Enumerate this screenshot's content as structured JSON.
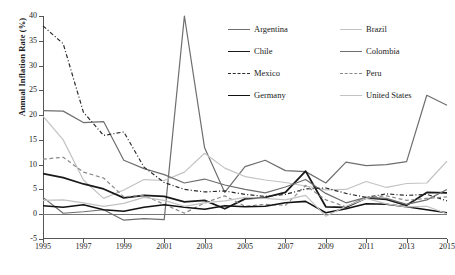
{
  "chart_data": {
    "type": "line",
    "title": "",
    "xlabel": "",
    "ylabel": "Annual Inflation Rate (%)",
    "xlim": [
      1995,
      2015
    ],
    "ylim": [
      -5,
      40
    ],
    "yticks": [
      -5,
      0,
      5,
      10,
      15,
      20,
      25,
      30,
      35,
      40
    ],
    "xticks": [
      1995,
      1997,
      1999,
      2001,
      2003,
      2005,
      2007,
      2009,
      2011,
      2013,
      2015
    ],
    "grid": false,
    "legend_position": "top-right",
    "x": [
      1995,
      1996,
      1997,
      1998,
      1999,
      2000,
      2001,
      2002,
      2003,
      2004,
      2005,
      2006,
      2007,
      2008,
      2009,
      2010,
      2011,
      2012,
      2013,
      2014,
      2015
    ],
    "series": [
      {
        "name": "Argentina",
        "color": "#6e6e6e",
        "width": 1.2,
        "dash": "none",
        "values": [
          3.4,
          0.2,
          0.5,
          0.9,
          -1.2,
          -0.9,
          -1.1,
          40.0,
          13.4,
          4.4,
          9.6,
          10.9,
          8.8,
          8.6,
          6.3,
          10.5,
          9.8,
          10.0,
          10.6,
          24.0,
          22.0
        ]
      },
      {
        "name": "Brazil",
        "color": "#c2c2c2",
        "width": 1.2,
        "dash": "none",
        "values": [
          19.8,
          15.0,
          6.9,
          3.2,
          4.9,
          7.0,
          6.8,
          8.5,
          12.3,
          9.3,
          7.6,
          6.9,
          6.4,
          5.7,
          4.9,
          5.0,
          6.6,
          5.4,
          6.2,
          6.3,
          10.7
        ]
      },
      {
        "name": "Chile",
        "color": "#1a1a1a",
        "width": 1.8,
        "dash": "none",
        "values": [
          8.2,
          7.4,
          6.1,
          5.1,
          3.3,
          3.8,
          3.6,
          2.5,
          2.8,
          1.1,
          3.1,
          3.4,
          4.4,
          8.7,
          1.5,
          1.4,
          3.3,
          3.0,
          1.8,
          4.4,
          4.3
        ]
      },
      {
        "name": "Colombia",
        "color": "#6e6e6e",
        "width": 1.2,
        "dash": "none",
        "values": [
          20.9,
          20.8,
          18.5,
          18.7,
          10.9,
          9.2,
          8.0,
          6.3,
          7.1,
          5.9,
          5.0,
          4.3,
          5.5,
          7.0,
          4.2,
          2.3,
          3.4,
          3.2,
          2.0,
          2.9,
          5.0
        ]
      },
      {
        "name": "Mexico",
        "color": "#2b2b2b",
        "width": 1.2,
        "dash": "dashdot",
        "values": [
          38.0,
          34.4,
          20.6,
          15.9,
          16.6,
          9.5,
          6.4,
          5.0,
          4.5,
          4.7,
          4.0,
          3.6,
          4.0,
          5.1,
          5.3,
          4.2,
          3.4,
          4.1,
          3.8,
          4.0,
          2.7
        ]
      },
      {
        "name": "Peru",
        "color": "#8a8a8a",
        "width": 1.2,
        "dash": "dash",
        "values": [
          11.1,
          11.5,
          8.5,
          7.3,
          3.5,
          3.8,
          2.0,
          0.2,
          2.3,
          3.7,
          1.6,
          2.0,
          1.8,
          5.8,
          2.9,
          1.5,
          3.4,
          3.7,
          2.8,
          3.2,
          3.5
        ]
      },
      {
        "name": "Germany",
        "color": "#111111",
        "width": 1.6,
        "dash": "none",
        "values": [
          1.7,
          1.4,
          1.9,
          0.9,
          0.6,
          1.4,
          1.9,
          1.4,
          1.0,
          1.7,
          1.5,
          1.6,
          2.3,
          2.6,
          0.3,
          1.1,
          2.1,
          2.0,
          1.5,
          0.9,
          0.3
        ]
      },
      {
        "name": "United States",
        "color": "#c2c2c2",
        "width": 1.2,
        "dash": "none",
        "values": [
          2.8,
          2.9,
          2.3,
          1.6,
          2.2,
          3.4,
          2.8,
          1.6,
          2.3,
          2.7,
          3.4,
          3.2,
          2.9,
          3.8,
          -0.4,
          1.6,
          3.2,
          2.1,
          1.5,
          1.6,
          0.1
        ]
      }
    ],
    "legend": [
      {
        "name": "Argentina",
        "color": "#6e6e6e",
        "width": 1.2,
        "dash": "none"
      },
      {
        "name": "Brazil",
        "color": "#c2c2c2",
        "width": 1.2,
        "dash": "none"
      },
      {
        "name": "Chile",
        "color": "#1a1a1a",
        "width": 1.8,
        "dash": "none"
      },
      {
        "name": "Colombia",
        "color": "#6e6e6e",
        "width": 1.2,
        "dash": "none"
      },
      {
        "name": "Mexico",
        "color": "#2b2b2b",
        "width": 1.2,
        "dash": "dashdot"
      },
      {
        "name": "Peru",
        "color": "#8a8a8a",
        "width": 1.2,
        "dash": "dash"
      },
      {
        "name": "Germany",
        "color": "#111111",
        "width": 1.6,
        "dash": "none"
      },
      {
        "name": "United States",
        "color": "#c2c2c2",
        "width": 1.2,
        "dash": "none"
      }
    ]
  }
}
